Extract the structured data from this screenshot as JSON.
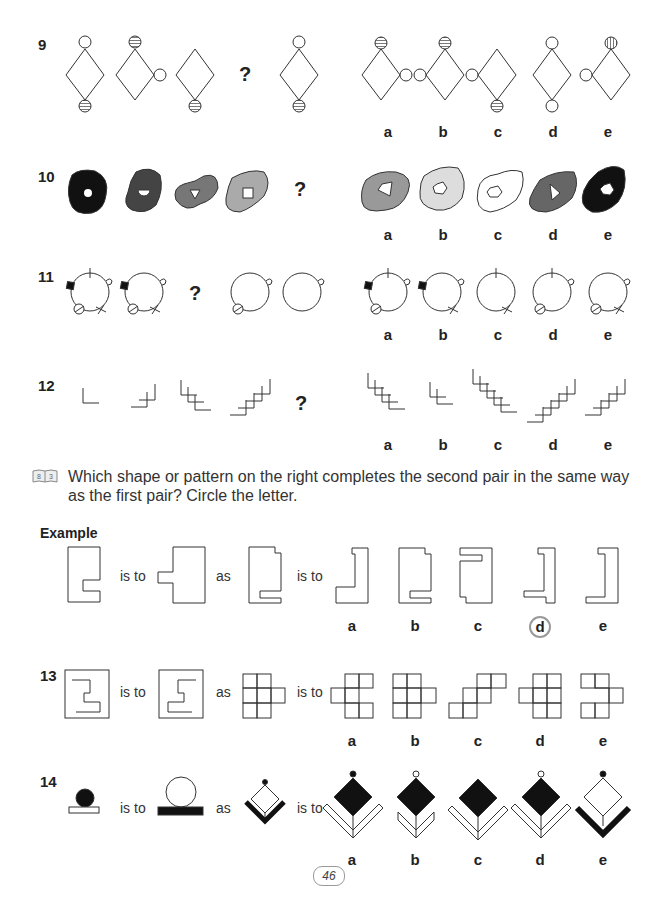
{
  "page": {
    "page_number": "46",
    "instruction_icon": "book-icon",
    "instruction_icon_label": "8 3",
    "instruction": "Which shape or pattern on the right completes the second pair in the same way as the first pair? Circle the letter.",
    "example_label": "Example",
    "is_to": "is to",
    "as": "as",
    "question_mark": "?"
  },
  "options": [
    "a",
    "b",
    "c",
    "d",
    "e"
  ],
  "questions": [
    {
      "number": "9"
    },
    {
      "number": "10"
    },
    {
      "number": "11"
    },
    {
      "number": "12"
    },
    {
      "number": "13"
    },
    {
      "number": "14"
    }
  ],
  "example": {
    "circled_answer": "d"
  }
}
